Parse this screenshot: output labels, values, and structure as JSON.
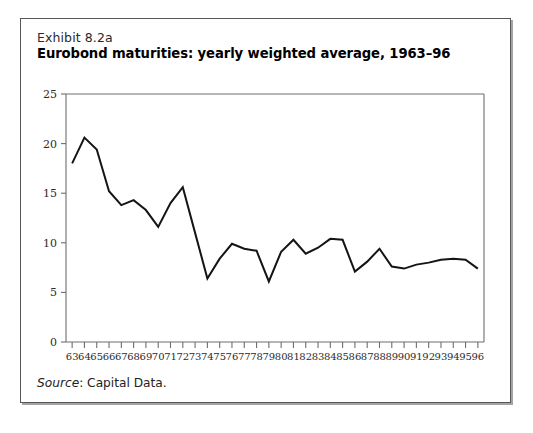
{
  "exhibit": {
    "label": "Exhibit 8.2a",
    "title": "Eurobond maturities: yearly weighted average, 1963–96",
    "source_prefix": "Source",
    "source_text": ": Capital Data."
  },
  "chart_data": {
    "type": "line",
    "title": "Eurobond maturities: yearly weighted average, 1963–96",
    "subtitle": "Exhibit 8.2a",
    "xlabel": "",
    "ylabel": "",
    "ylim": [
      0,
      25
    ],
    "yticks": [
      0,
      5,
      10,
      15,
      20,
      25
    ],
    "ytick_labels": [
      "0",
      "5",
      "10",
      "15",
      "20",
      "25"
    ],
    "grid": false,
    "legend": null,
    "line_color": "#141414",
    "axis_color": "#6e6e70",
    "categories": [
      "63",
      "64",
      "65",
      "66",
      "67",
      "68",
      "69",
      "70",
      "71",
      "72",
      "73",
      "74",
      "75",
      "76",
      "77",
      "78",
      "79",
      "80",
      "81",
      "82",
      "83",
      "84",
      "85",
      "86",
      "87",
      "88",
      "89",
      "90",
      "91",
      "92",
      "93",
      "94",
      "95",
      "96"
    ],
    "x": [
      1963,
      1964,
      1965,
      1966,
      1967,
      1968,
      1969,
      1970,
      1971,
      1972,
      1973,
      1974,
      1975,
      1976,
      1977,
      1978,
      1979,
      1980,
      1981,
      1982,
      1983,
      1984,
      1985,
      1986,
      1987,
      1988,
      1989,
      1990,
      1991,
      1992,
      1993,
      1994,
      1995,
      1996
    ],
    "values": [
      18.0,
      20.6,
      19.4,
      15.2,
      13.8,
      14.3,
      13.3,
      11.6,
      14.0,
      15.6,
      11.0,
      6.4,
      8.4,
      9.9,
      9.4,
      9.2,
      6.1,
      9.1,
      10.3,
      8.9,
      9.5,
      10.4,
      10.3,
      7.1,
      8.1,
      9.4,
      7.6,
      7.4,
      7.8,
      8.0,
      8.3,
      8.4,
      8.3,
      7.4
    ],
    "annotations": [
      "Source: Capital Data."
    ]
  }
}
